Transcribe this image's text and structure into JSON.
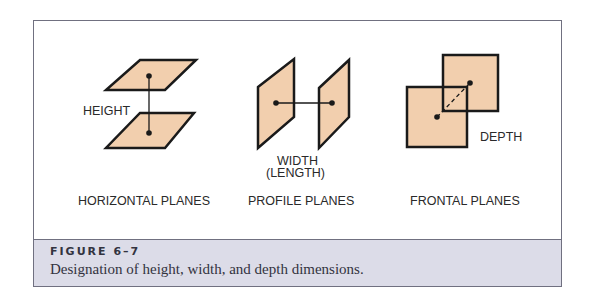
{
  "figure": {
    "number": "FIGURE 6–7",
    "caption": "Designation of height, width, and depth dimensions.",
    "panels": [
      {
        "id": "horizontal",
        "title": "HORIZONTAL PLANES",
        "dimension_label": "HEIGHT"
      },
      {
        "id": "profile",
        "title": "PROFILE PLANES",
        "dimension_label_line1": "WIDTH",
        "dimension_label_line2": "(LENGTH)"
      },
      {
        "id": "frontal",
        "title": "FRONTAL PLANES",
        "dimension_label": "DEPTH"
      }
    ]
  },
  "colors": {
    "plane_fill": "#f2cfae",
    "stroke": "#1a1a1a",
    "caption_bg": "#dcdce8",
    "frame_border": "#707080"
  }
}
